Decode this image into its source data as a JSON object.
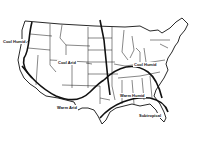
{
  "map": {
    "subject": "Climate regions of the contiguous United States",
    "line_color": "#111111",
    "background": "#ffffff",
    "regions": [
      {
        "id": "cool-humid-west",
        "label": "Cool Humid"
      },
      {
        "id": "cool-arid",
        "label": "Cool Arid"
      },
      {
        "id": "cool-humid-east",
        "label": "Cool Humid"
      },
      {
        "id": "warm-arid",
        "label": "Warm Arid"
      },
      {
        "id": "warm-humid",
        "label": "Warm Humid"
      },
      {
        "id": "subtropical",
        "label": "Subtropical"
      }
    ]
  }
}
